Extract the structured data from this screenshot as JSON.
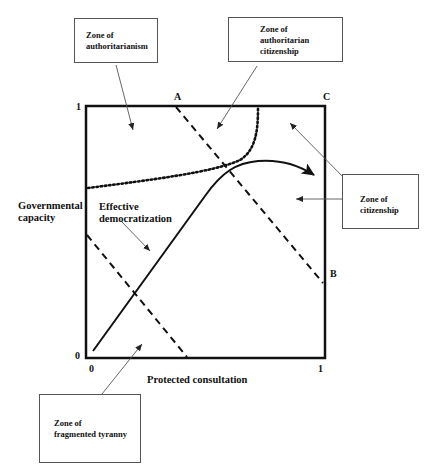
{
  "diagram": {
    "y_axis": {
      "title_line1": "Governmental",
      "title_line2": "capacity",
      "tick_top": "1",
      "tick_bottom": "0"
    },
    "x_axis": {
      "title": "Protected consultation",
      "tick_left": "0",
      "tick_right": "1"
    },
    "points": {
      "a": "A",
      "b": "B",
      "c": "C"
    },
    "inline_label": {
      "line1": "Effective",
      "line2": "democratization"
    },
    "callouts": {
      "authoritarianism": {
        "line1": "Zone of",
        "line2": "authoritarianism"
      },
      "authoritarian_citizenship": {
        "line1": "Zone of",
        "line2": "authoritarian",
        "line3": "citizenship"
      },
      "citizenship": {
        "line1": "Zone of",
        "line2": "citizenship"
      },
      "fragmented_tyranny": {
        "line1": "Zone of",
        "line2": "fragmented tyranny"
      }
    },
    "colors": {
      "frame": "#111111",
      "leader": "#555555",
      "callout_border": "#555555"
    }
  }
}
